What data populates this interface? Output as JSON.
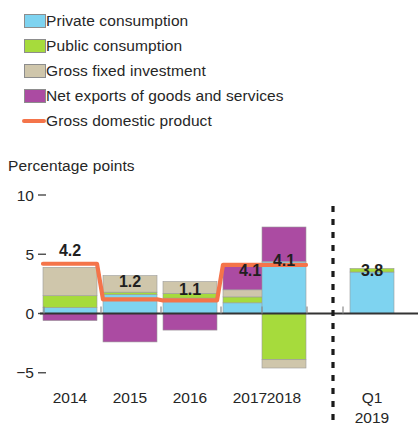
{
  "legend": {
    "items": [
      {
        "label": "Private consumption",
        "marker": "swatch",
        "icon": "square-swatch-icon",
        "color": "#7ED3F0"
      },
      {
        "label": "Public consumption",
        "marker": "swatch",
        "icon": "square-swatch-icon",
        "color": "#A6DB3C"
      },
      {
        "label": "Gross fixed investment",
        "marker": "swatch",
        "icon": "square-swatch-icon",
        "color": "#CFC6AB"
      },
      {
        "label": "Net exports of goods and services",
        "marker": "swatch",
        "icon": "square-swatch-icon",
        "color": "#AB4BA2"
      },
      {
        "label": "Gross domestic product",
        "marker": "line",
        "icon": "line-swatch-icon",
        "color": "#F4744A"
      }
    ]
  },
  "axis_title": "Percentage points",
  "chart_data": {
    "type": "bar",
    "title": "",
    "subtitle": "",
    "xlabel": "",
    "ylabel": "Percentage points",
    "ylim": [
      -6.5,
      10.5
    ],
    "yticks": [
      10,
      5,
      0,
      -5
    ],
    "ytick_labels": [
      "10",
      "5",
      "0",
      "−5"
    ],
    "grid": false,
    "legend_position": "top-left",
    "stacked": true,
    "categories": [
      "2014",
      "2015",
      "2016",
      "2017",
      "2018",
      "Q1\n2019"
    ],
    "category_labels": [
      {
        "line1": "2014",
        "line2": ""
      },
      {
        "line1": "2015",
        "line2": ""
      },
      {
        "line1": "2016",
        "line2": ""
      },
      {
        "line1": "2017",
        "line2": ""
      },
      {
        "line1": "2018",
        "line2": ""
      },
      {
        "line1": "Q1",
        "line2": "2019"
      }
    ],
    "series": [
      {
        "name": "Private consumption",
        "color": "#7ED3F0",
        "values": [
          0.5,
          1.6,
          1.3,
          0.9,
          4.4,
          3.5
        ]
      },
      {
        "name": "Public consumption",
        "color": "#A6DB3C",
        "values": [
          1.0,
          0.2,
          0.4,
          0.5,
          -3.9,
          0.3
        ]
      },
      {
        "name": "Gross fixed investment",
        "color": "#CFC6AB",
        "values": [
          2.4,
          1.4,
          1.0,
          0.6,
          -0.7,
          0.0
        ]
      },
      {
        "name": "Net exports of goods and services",
        "color": "#AB4BA2",
        "values": [
          -0.6,
          -2.4,
          -1.4,
          2.1,
          2.9,
          0.0
        ]
      }
    ],
    "line_series": {
      "name": "Gross domestic product",
      "color": "#F4744A",
      "values": [
        4.2,
        1.2,
        1.1,
        4.1,
        4.1,
        null
      ]
    },
    "value_labels": [
      "4.2",
      "1.2",
      "1.1",
      "4.1",
      "4.1",
      "3.8"
    ],
    "divider": {
      "after_category_index": 4,
      "style": "dashed",
      "color": "#1a1a1a"
    },
    "zero_line_color": "#333333"
  }
}
